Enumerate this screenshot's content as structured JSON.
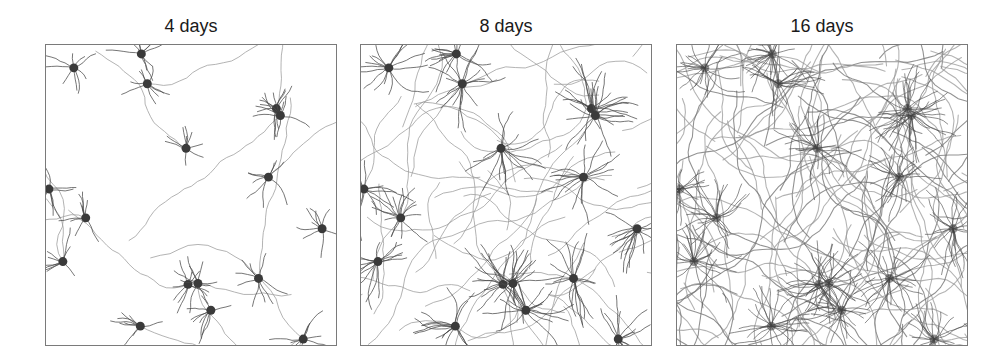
{
  "figure": {
    "panels": [
      {
        "title": "4 days",
        "density": 1,
        "x": 45
      },
      {
        "title": "8 days",
        "density": 2,
        "x": 360
      },
      {
        "title": "16 days",
        "density": 4,
        "x": 676
      }
    ],
    "somata": [
      [
        28,
        23
      ],
      [
        96,
        9
      ],
      [
        102,
        39
      ],
      [
        232,
        64
      ],
      [
        236,
        71
      ],
      [
        141,
        104
      ],
      [
        224,
        133
      ],
      [
        3,
        145
      ],
      [
        40,
        174
      ],
      [
        278,
        185
      ],
      [
        17,
        218
      ],
      [
        143,
        241
      ],
      [
        153,
        240
      ],
      [
        214,
        235
      ],
      [
        166,
        267
      ],
      [
        95,
        283
      ],
      [
        259,
        296
      ]
    ],
    "colors": {
      "soma": "#3a3a3a",
      "dendrite": "#4a4a4a",
      "axon": "#9a9a9a",
      "axon_dense": "#8c8c8c",
      "border": "#7a7a7a"
    }
  }
}
